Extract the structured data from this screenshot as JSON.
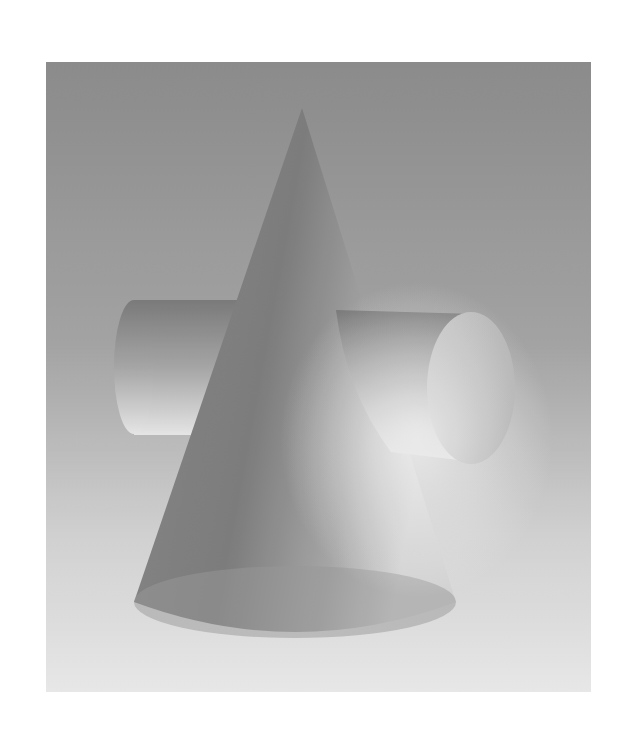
{
  "image": {
    "subject": "Grayscale photograph of a cone intersected by a horizontal cylinder",
    "alt": "Cone pierced by a cylinder",
    "colors": {
      "page_background": "#ffffff",
      "backdrop_top": "#8a8a8a",
      "backdrop_bottom": "#ececec",
      "cone_dark": "#7a7a7a",
      "cone_light": "#c8c8c8",
      "cylinder_dark": "#7e7e7e",
      "cylinder_light": "#e6e6e6",
      "cylinder_end_face": "#bdbdbd"
    }
  }
}
